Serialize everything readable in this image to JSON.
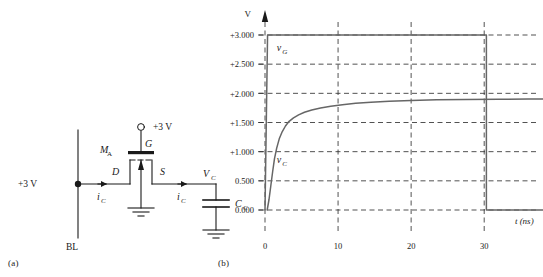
{
  "figure": {
    "caption_a": "(a)",
    "caption_b": "(b)"
  },
  "circuit": {
    "supply_label": "+3 V",
    "gate_supply_label": "+3 V",
    "node_label": "+3 V",
    "bitline_label": "BL",
    "transistor_label": "M",
    "transistor_sub": "A",
    "gate_terminal": "G",
    "drain_terminal": "D",
    "source_terminal": "S",
    "current_label": "i",
    "current_sub": "C",
    "cap_node_label": "V",
    "cap_node_sub": "C",
    "cap_label": "C",
    "cap_sub": "C"
  },
  "chart_data": {
    "type": "line",
    "title": "",
    "xlabel": "t (ns)",
    "ylabel": "V",
    "xlim": [
      -2,
      40
    ],
    "ylim": [
      -0.35,
      3.25
    ],
    "x_ticks": [
      0,
      10,
      20,
      30
    ],
    "x_tick_labels": [
      "0",
      "10",
      "20",
      "30"
    ],
    "y_ticks": [
      0.0,
      0.5,
      1.0,
      1.5,
      2.0,
      2.5,
      3.0
    ],
    "y_tick_labels": [
      "0.000",
      "0.500",
      "+1.000",
      "+1.500",
      "+2.000",
      "+2.500",
      "+3.000"
    ],
    "grid": "dashed",
    "legend": "inline-annotations",
    "annotations": [
      {
        "name": "vG",
        "text": "v",
        "sub": "G",
        "x": 1.6,
        "y": 2.72
      },
      {
        "name": "vC",
        "text": "v",
        "sub": "C",
        "x": 1.6,
        "y": 0.8
      }
    ],
    "series": [
      {
        "name": "vG",
        "label": "v_G",
        "color": "#666666",
        "points": [
          [
            0.0,
            0.0
          ],
          [
            0.35,
            3.0
          ],
          [
            30.3,
            3.0
          ],
          [
            30.3,
            0.0
          ],
          [
            39.5,
            0.0
          ]
        ]
      },
      {
        "name": "vC",
        "label": "v_C",
        "color": "#666666",
        "points": [
          [
            0.3,
            0.0
          ],
          [
            0.55,
            0.18
          ],
          [
            0.8,
            0.42
          ],
          [
            1.05,
            0.66
          ],
          [
            1.3,
            0.88
          ],
          [
            1.6,
            1.06
          ],
          [
            1.95,
            1.22
          ],
          [
            2.35,
            1.34
          ],
          [
            2.8,
            1.44
          ],
          [
            3.3,
            1.52
          ],
          [
            3.9,
            1.58
          ],
          [
            4.6,
            1.63
          ],
          [
            5.4,
            1.675
          ],
          [
            6.4,
            1.715
          ],
          [
            7.6,
            1.75
          ],
          [
            9.0,
            1.78
          ],
          [
            10.6,
            1.805
          ],
          [
            12.4,
            1.828
          ],
          [
            14.5,
            1.848
          ],
          [
            17.0,
            1.864
          ],
          [
            20.0,
            1.878
          ],
          [
            23.5,
            1.888
          ],
          [
            27.5,
            1.895
          ],
          [
            32.0,
            1.899
          ],
          [
            36.0,
            1.901
          ],
          [
            39.5,
            1.902
          ]
        ]
      }
    ]
  }
}
